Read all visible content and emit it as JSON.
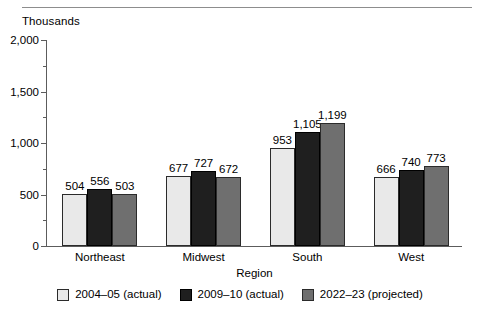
{
  "chart_data": {
    "type": "bar",
    "title": "",
    "unit_label": "Thousands",
    "xlabel": "Region",
    "ylabel": "",
    "categories": [
      "Northeast",
      "Midwest",
      "South",
      "West"
    ],
    "series": [
      {
        "name": "2004–05 (actual)",
        "color": "#e9e9e9",
        "values": [
          504,
          677,
          953,
          666
        ]
      },
      {
        "name": "2009–10 (actual)",
        "color": "#1f1f1f",
        "values": [
          556,
          727,
          1105,
          740
        ]
      },
      {
        "name": "2022–23 (projected)",
        "color": "#6f6f6f",
        "values": [
          503,
          672,
          1199,
          773
        ]
      }
    ],
    "value_labels": [
      [
        "504",
        "556",
        "503"
      ],
      [
        "677",
        "727",
        "672"
      ],
      [
        "953",
        "1,105",
        "1,199"
      ],
      [
        "666",
        "740",
        "773"
      ]
    ],
    "ylim": [
      0,
      2000
    ],
    "ytick_values": [
      0,
      500,
      1000,
      1500,
      2000
    ],
    "ytick_labels": [
      "0",
      "500",
      "1,000",
      "1,500",
      "2,000"
    ],
    "yminor_values": [
      250,
      750,
      1250,
      1750
    ],
    "grid": false,
    "legend_position": "bottom"
  },
  "legend": {
    "items": [
      {
        "label": "2004–05 (actual)"
      },
      {
        "label": "2009–10 (actual)"
      },
      {
        "label": "2022–23 (projected)"
      }
    ]
  }
}
